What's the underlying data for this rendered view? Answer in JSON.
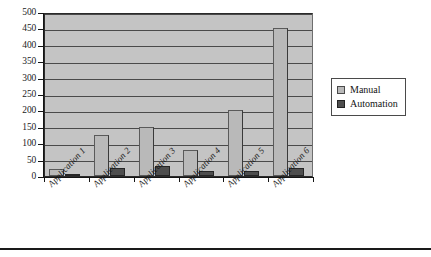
{
  "chart_data": {
    "type": "bar",
    "title": "",
    "subtitle": "",
    "xlabel": "",
    "ylabel": "",
    "ylim": [
      0,
      500
    ],
    "ytick_step": 50,
    "yticks": [
      500,
      450,
      400,
      350,
      300,
      250,
      200,
      150,
      100,
      50,
      0
    ],
    "ytick_labels": [
      "500",
      "450",
      "400",
      "350",
      "300",
      "250",
      "200",
      "150",
      "100",
      "50",
      "0"
    ],
    "grid": true,
    "grid_axis": "y",
    "legend_position": "right",
    "categories": [
      "Application 1",
      "Application 2",
      "Application 3",
      "Application 4",
      "Application 5",
      "Application 6"
    ],
    "series": [
      {
        "name": "Manual",
        "color": "#b9b9b9",
        "values": [
          20,
          125,
          150,
          80,
          200,
          450
        ]
      },
      {
        "name": "Automation",
        "color": "#4e4e4e",
        "values": [
          3,
          25,
          30,
          15,
          15,
          25
        ]
      }
    ],
    "annotations": []
  },
  "legend": {
    "entries": [
      {
        "label": "Manual",
        "swatch": "manual"
      },
      {
        "label": "Automation",
        "swatch": "automation"
      }
    ]
  },
  "colors": {
    "plot_background": "#c4c4c4",
    "gridline": "#4a4a4a",
    "axis": "#151515",
    "manual": "#b9b9b9",
    "automation": "#4e4e4e",
    "page_background": "#ffffff",
    "rule": "#1a1a1a"
  }
}
